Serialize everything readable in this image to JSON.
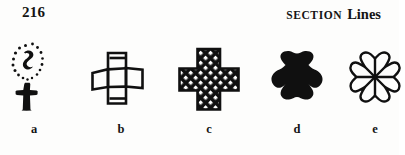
{
  "page": {
    "folio": "216",
    "header": {
      "smallcaps_word": "Section",
      "bold_word": "Lines"
    }
  },
  "figure": {
    "panels": [
      {
        "id": "a",
        "caption": "a",
        "symbol_name": "latin-cross-with-dotted-halo",
        "description": "Latin cross beneath an oval ring of dots enclosing a small hook stroke",
        "fill_style": "solid black with stippled dot ring"
      },
      {
        "id": "b",
        "caption": "b",
        "symbol_name": "outline-greek-cross",
        "description": "Greek cross drawn in outline with internal dividing lines",
        "fill_style": "outline, no section lines"
      },
      {
        "id": "c",
        "caption": "c",
        "symbol_name": "crosshatched-greek-cross",
        "description": "Greek cross filled with crossed diagonal section lines",
        "fill_style": "diagonal crosshatch"
      },
      {
        "id": "d",
        "caption": "d",
        "symbol_name": "solid-cross-pattee",
        "description": "Cross pattee filled solid black",
        "fill_style": "solid black"
      },
      {
        "id": "e",
        "caption": "e",
        "symbol_name": "outline-cross-pattee-with-rays",
        "description": "Cross pattee in outline with rays radiating from centre",
        "fill_style": "outline with radiating lines"
      }
    ]
  },
  "colors": {
    "ink": "#101010",
    "paper": "#fdfdfc"
  }
}
